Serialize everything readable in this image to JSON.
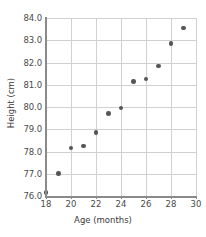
{
  "chart_data": {
    "type": "scatter",
    "title": "",
    "xlabel": "Age (months)",
    "ylabel": "Height (cm)",
    "xlim": [
      18,
      30
    ],
    "ylim": [
      76.0,
      84.0
    ],
    "xticks": [
      18,
      20,
      22,
      24,
      26,
      28,
      30
    ],
    "xtick_labels": [
      "18",
      "20",
      "22",
      "24",
      "26",
      "28",
      "30"
    ],
    "yticks": [
      76.0,
      77.0,
      78.0,
      79.0,
      80.0,
      81.0,
      82.0,
      83.0,
      84.0
    ],
    "ytick_labels": [
      "76.0",
      "77.0",
      "78.0",
      "79.0",
      "80.0",
      "81.0",
      "82.0",
      "83.0",
      "84.0"
    ],
    "grid": true,
    "legend": null,
    "marker_color": "#555555",
    "grid_color": "#d0d0d0",
    "axis_color": "#8a8a8a",
    "x": [
      18,
      19,
      20,
      21,
      22,
      23,
      24,
      25,
      26,
      27,
      28,
      29
    ],
    "y": [
      76.15,
      77.0,
      78.15,
      78.25,
      78.85,
      79.7,
      79.95,
      81.15,
      81.25,
      81.85,
      82.85,
      83.55
    ],
    "points": [
      {
        "x": 18,
        "y": 76.15
      },
      {
        "x": 19,
        "y": 77.0
      },
      {
        "x": 20,
        "y": 78.15
      },
      {
        "x": 21,
        "y": 78.25
      },
      {
        "x": 22,
        "y": 78.85
      },
      {
        "x": 23,
        "y": 79.7
      },
      {
        "x": 24,
        "y": 79.95
      },
      {
        "x": 25,
        "y": 81.15
      },
      {
        "x": 26,
        "y": 81.25
      },
      {
        "x": 27,
        "y": 81.85
      },
      {
        "x": 28,
        "y": 82.85
      },
      {
        "x": 29,
        "y": 83.55
      }
    ]
  }
}
